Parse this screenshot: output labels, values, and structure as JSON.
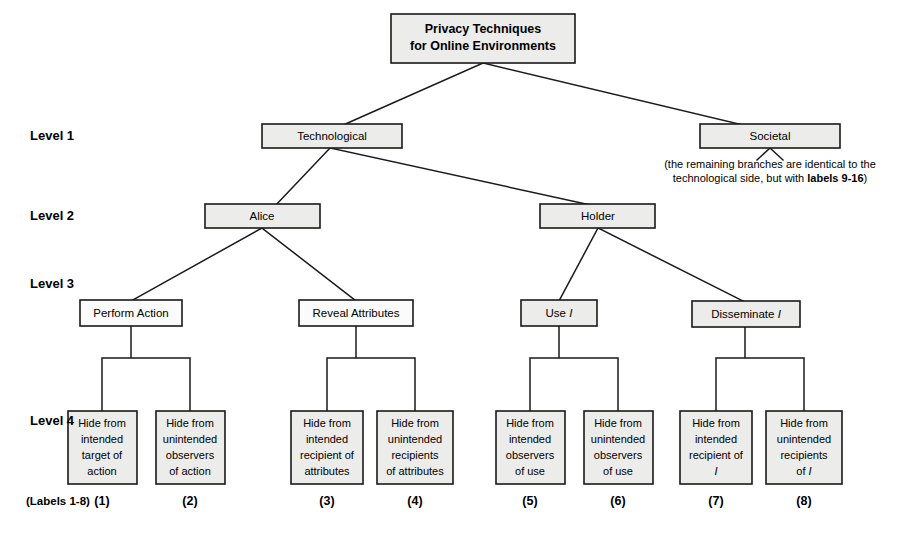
{
  "diagram": {
    "root": {
      "line1": "Privacy Techniques",
      "line2": "for Online Environments"
    },
    "level_labels": [
      {
        "id": "level-1",
        "text": "Level 1"
      },
      {
        "id": "level-2",
        "text": "Level 2"
      },
      {
        "id": "level-3",
        "text": "Level 3"
      },
      {
        "id": "level-4",
        "text": "Level 4"
      }
    ],
    "level1": {
      "technological": "Technological",
      "societal": "Societal"
    },
    "societal_note": {
      "line1": "(the remaining branches are identical to the",
      "line2_prefix": "technological side, but with ",
      "line2_strong": "labels 9-16",
      "line2_suffix": ")"
    },
    "level2": {
      "alice": "Alice",
      "holder": "Holder"
    },
    "level3": [
      {
        "id": "perform-action",
        "text": "Perform Action",
        "italic_suffix": ""
      },
      {
        "id": "reveal-attributes",
        "text": "Reveal Attributes",
        "italic_suffix": ""
      },
      {
        "id": "use-i",
        "text": "Use ",
        "italic_suffix": "I"
      },
      {
        "id": "disseminate-i",
        "text": "Disseminate ",
        "italic_suffix": "I"
      }
    ],
    "level4": [
      {
        "id": "leaf-1",
        "lines": [
          "Hide from",
          "intended",
          "target of",
          "action"
        ],
        "italic_last": "",
        "index": "(1)"
      },
      {
        "id": "leaf-2",
        "lines": [
          "Hide from",
          "unintended",
          "observers",
          "of action"
        ],
        "italic_last": "",
        "index": "(2)"
      },
      {
        "id": "leaf-3",
        "lines": [
          "Hide from",
          "intended",
          "recipient of",
          "attributes"
        ],
        "italic_last": "",
        "index": "(3)"
      },
      {
        "id": "leaf-4",
        "lines": [
          "Hide from",
          "unintended",
          "recipients",
          "of attributes"
        ],
        "italic_last": "",
        "index": "(4)"
      },
      {
        "id": "leaf-5",
        "lines": [
          "Hide from",
          "intended",
          "observers",
          "of use"
        ],
        "italic_last": "",
        "index": "(5)"
      },
      {
        "id": "leaf-6",
        "lines": [
          "Hide from",
          "unintended",
          "observers",
          "of use"
        ],
        "italic_last": "",
        "index": "(6)"
      },
      {
        "id": "leaf-7",
        "lines": [
          "Hide from",
          "intended",
          "recipient of",
          ""
        ],
        "italic_last": "I",
        "index": "(7)"
      },
      {
        "id": "leaf-8",
        "lines": [
          "Hide from",
          "unintended",
          "recipients",
          "of "
        ],
        "italic_last": "I",
        "index": "(8)"
      }
    ],
    "labels_caption": "(Labels 1-8)",
    "colors": {
      "box_fill": "#ececeb",
      "box_fill_light": "#fbfbfb",
      "stroke": "#1a1a1a",
      "background": "#ffffff"
    }
  }
}
